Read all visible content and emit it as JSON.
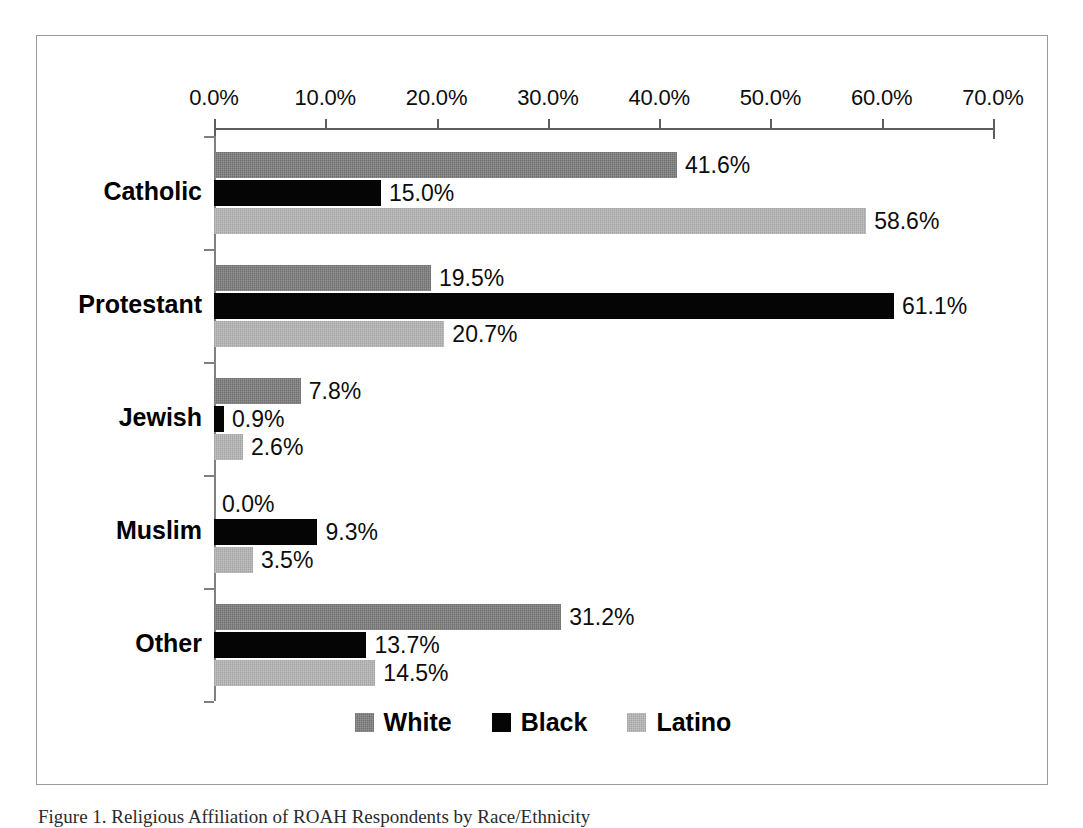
{
  "figure": {
    "caption": "Figure 1. Religious Affiliation of ROAH Respondents by Race/Ethnicity"
  },
  "legend": {
    "position": "bottom-center",
    "entries": [
      {
        "label": "White",
        "color": "#7d7d7d",
        "swatch_name": "legend-swatch-white"
      },
      {
        "label": "Black",
        "color": "#050505",
        "swatch_name": "legend-swatch-black"
      },
      {
        "label": "Latino",
        "color": "#b0b0b0",
        "swatch_name": "legend-swatch-latino"
      }
    ]
  },
  "axis": {
    "x_ticks": [
      "0.0%",
      "10.0%",
      "20.0%",
      "30.0%",
      "40.0%",
      "50.0%",
      "60.0%",
      "70.0%"
    ],
    "y_categories": [
      "Catholic",
      "Protestant",
      "Jewish",
      "Muslim",
      "Other"
    ]
  },
  "labels": {
    "catholic": {
      "white": "41.6%",
      "black": "15.0%",
      "latino": "58.6%"
    },
    "protestant": {
      "white": "19.5%",
      "black": "61.1%",
      "latino": "20.7%"
    },
    "jewish": {
      "white": "7.8%",
      "black": "0.9%",
      "latino": "2.6%"
    },
    "muslim": {
      "white": "0.0%",
      "black": "9.3%",
      "latino": "3.5%"
    },
    "other": {
      "white": "31.2%",
      "black": "13.7%",
      "latino": "14.5%"
    }
  },
  "chart_data": {
    "type": "bar",
    "orientation": "horizontal",
    "title": "",
    "subtitle": "",
    "xlabel": "",
    "ylabel": "",
    "xlim": [
      0,
      70
    ],
    "xtick_values": [
      0,
      10,
      20,
      30,
      40,
      50,
      60,
      70
    ],
    "xtick_labels": [
      "0.0%",
      "10.0%",
      "20.0%",
      "30.0%",
      "40.0%",
      "50.0%",
      "60.0%",
      "70.0%"
    ],
    "x_axis_position": "top",
    "grid": false,
    "legend_position": "bottom-center",
    "value_labels": true,
    "value_label_suffix": "%",
    "categories": [
      "Catholic",
      "Protestant",
      "Jewish",
      "Muslim",
      "Other"
    ],
    "series": [
      {
        "name": "White",
        "color": "#7d7d7d",
        "values": [
          41.6,
          19.5,
          7.8,
          0.0,
          31.2
        ]
      },
      {
        "name": "Black",
        "color": "#050505",
        "values": [
          15.0,
          61.1,
          0.9,
          9.3,
          13.7
        ]
      },
      {
        "name": "Latino",
        "color": "#b0b0b0",
        "values": [
          58.6,
          20.7,
          2.6,
          3.5,
          14.5
        ]
      }
    ]
  }
}
